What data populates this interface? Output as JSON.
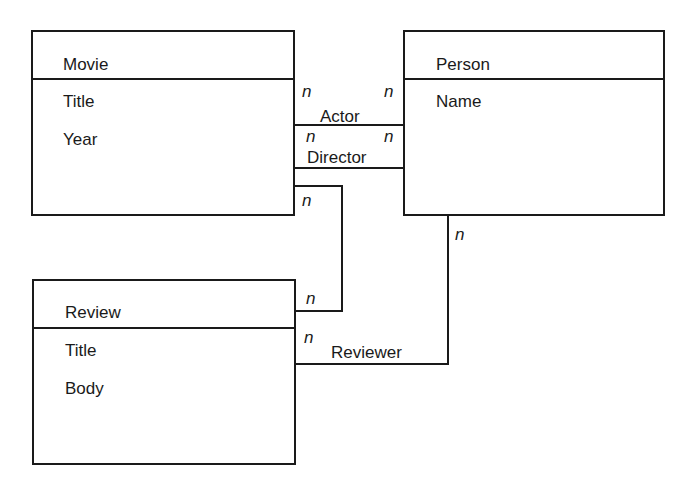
{
  "entities": [
    {
      "name": "Movie",
      "attributes": [
        "Title",
        "Year"
      ]
    },
    {
      "name": "Person",
      "attributes": [
        "Name"
      ]
    },
    {
      "name": "Review",
      "attributes": [
        "Title",
        "Body"
      ]
    }
  ],
  "relationships": [
    {
      "label": "Actor",
      "from": "Movie",
      "to": "Person",
      "from_mult": "n",
      "to_mult": "n"
    },
    {
      "label": "Director",
      "from": "Movie",
      "to": "Person",
      "from_mult": "n",
      "to_mult": "n"
    },
    {
      "label": "",
      "from": "Movie",
      "to": "Review",
      "from_mult": "n",
      "to_mult": "n"
    },
    {
      "label": "Reviewer",
      "from": "Person",
      "to": "Review",
      "from_mult": "n",
      "to_mult": "n"
    }
  ]
}
